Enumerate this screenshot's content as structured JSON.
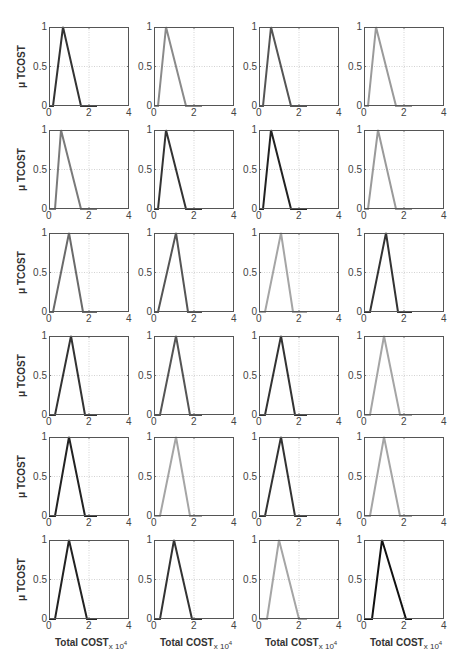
{
  "chart_data": {
    "type": "line",
    "layout": {
      "rows": 6,
      "cols": 4,
      "grid": true
    },
    "ylabel": "μ TCOST",
    "xlabel": "Total COST",
    "xlabel_multiplier": "x 10",
    "xlabel_exponent": "4",
    "xlim": [
      0,
      4
    ],
    "ylim": [
      0,
      1
    ],
    "xticks": [
      "0",
      "2",
      "4"
    ],
    "yticks": [
      "0",
      "0.5",
      "1"
    ],
    "panels": [
      {
        "row": 1,
        "col": 1,
        "color": "#333333",
        "x": [
          0,
          0.2,
          0.7,
          1.6,
          2.4
        ],
        "y": [
          0,
          0,
          1,
          0,
          0
        ]
      },
      {
        "row": 1,
        "col": 2,
        "color": "#8a8a8a",
        "x": [
          0,
          0.2,
          0.6,
          1.6,
          2.4
        ],
        "y": [
          0,
          0,
          1,
          0,
          0
        ]
      },
      {
        "row": 1,
        "col": 3,
        "color": "#555555",
        "x": [
          0,
          0.2,
          0.6,
          1.6,
          2.4
        ],
        "y": [
          0,
          0,
          1,
          0,
          0
        ]
      },
      {
        "row": 1,
        "col": 4,
        "color": "#9a9a9a",
        "x": [
          0,
          0.2,
          0.6,
          1.6,
          2.4
        ],
        "y": [
          0,
          0,
          1,
          0,
          0
        ]
      },
      {
        "row": 2,
        "col": 1,
        "color": "#7a7a7a",
        "x": [
          0,
          0.3,
          0.6,
          1.6,
          2.4
        ],
        "y": [
          0,
          0,
          1,
          0,
          0
        ]
      },
      {
        "row": 2,
        "col": 2,
        "color": "#333333",
        "x": [
          0,
          0.2,
          0.6,
          1.6,
          2.4
        ],
        "y": [
          0,
          0,
          1,
          0,
          0
        ]
      },
      {
        "row": 2,
        "col": 3,
        "color": "#222222",
        "x": [
          0,
          0.2,
          0.6,
          1.6,
          2.4
        ],
        "y": [
          0,
          0,
          1,
          0,
          0
        ]
      },
      {
        "row": 2,
        "col": 4,
        "color": "#9a9a9a",
        "x": [
          0,
          0.2,
          0.7,
          1.6,
          2.4
        ],
        "y": [
          0,
          0,
          1,
          0,
          0
        ]
      },
      {
        "row": 3,
        "col": 1,
        "color": "#6a6a6a",
        "x": [
          0,
          0.2,
          1.0,
          1.7,
          2.4
        ],
        "y": [
          0,
          0,
          1,
          0,
          0
        ]
      },
      {
        "row": 3,
        "col": 2,
        "color": "#555555",
        "x": [
          0,
          0.2,
          1.1,
          1.7,
          2.4
        ],
        "y": [
          0,
          0,
          1,
          0,
          0
        ]
      },
      {
        "row": 3,
        "col": 3,
        "color": "#a5a5a5",
        "x": [
          0,
          0.3,
          1.1,
          1.7,
          2.4
        ],
        "y": [
          0,
          0,
          1,
          0,
          0
        ]
      },
      {
        "row": 3,
        "col": 4,
        "color": "#333333",
        "x": [
          0,
          0.3,
          1.1,
          1.7,
          2.4
        ],
        "y": [
          0,
          0,
          1,
          0,
          0
        ]
      },
      {
        "row": 4,
        "col": 1,
        "color": "#333333",
        "x": [
          0,
          0.3,
          1.1,
          1.8,
          2.4
        ],
        "y": [
          0,
          0,
          1,
          0,
          0
        ]
      },
      {
        "row": 4,
        "col": 2,
        "color": "#555555",
        "x": [
          0,
          0.3,
          1.1,
          1.8,
          2.4
        ],
        "y": [
          0,
          0,
          1,
          0,
          0
        ]
      },
      {
        "row": 4,
        "col": 3,
        "color": "#333333",
        "x": [
          0,
          0.3,
          1.1,
          1.8,
          2.4
        ],
        "y": [
          0,
          0,
          1,
          0,
          0
        ]
      },
      {
        "row": 4,
        "col": 4,
        "color": "#a5a5a5",
        "x": [
          0,
          0.3,
          1.0,
          1.8,
          2.4
        ],
        "y": [
          0,
          0,
          1,
          0,
          0
        ]
      },
      {
        "row": 5,
        "col": 1,
        "color": "#222222",
        "x": [
          0,
          0.3,
          1.0,
          1.8,
          2.4
        ],
        "y": [
          0,
          0,
          1,
          0,
          0
        ]
      },
      {
        "row": 5,
        "col": 2,
        "color": "#a5a5a5",
        "x": [
          0,
          0.3,
          1.1,
          1.8,
          2.4
        ],
        "y": [
          0,
          0,
          1,
          0,
          0
        ]
      },
      {
        "row": 5,
        "col": 3,
        "color": "#333333",
        "x": [
          0,
          0.3,
          1.1,
          1.8,
          2.4
        ],
        "y": [
          0,
          0,
          1,
          0,
          0
        ]
      },
      {
        "row": 5,
        "col": 4,
        "color": "#a5a5a5",
        "x": [
          0,
          0.3,
          1.0,
          1.8,
          2.4
        ],
        "y": [
          0,
          0,
          1,
          0,
          0
        ]
      },
      {
        "row": 6,
        "col": 1,
        "color": "#222222",
        "x": [
          0,
          0.3,
          1.0,
          1.9,
          2.4
        ],
        "y": [
          0,
          0,
          1,
          0,
          0
        ]
      },
      {
        "row": 6,
        "col": 2,
        "color": "#333333",
        "x": [
          0,
          0.3,
          1.0,
          1.9,
          2.4
        ],
        "y": [
          0,
          0,
          1,
          0,
          0
        ]
      },
      {
        "row": 6,
        "col": 3,
        "color": "#a5a5a5",
        "x": [
          0,
          0.4,
          1.0,
          2.0,
          2.4
        ],
        "y": [
          0,
          0,
          1,
          0,
          0
        ]
      },
      {
        "row": 6,
        "col": 4,
        "color": "#111111",
        "x": [
          0,
          0.4,
          0.9,
          2.1,
          2.4
        ],
        "y": [
          0,
          0,
          1,
          0,
          0
        ]
      }
    ]
  }
}
